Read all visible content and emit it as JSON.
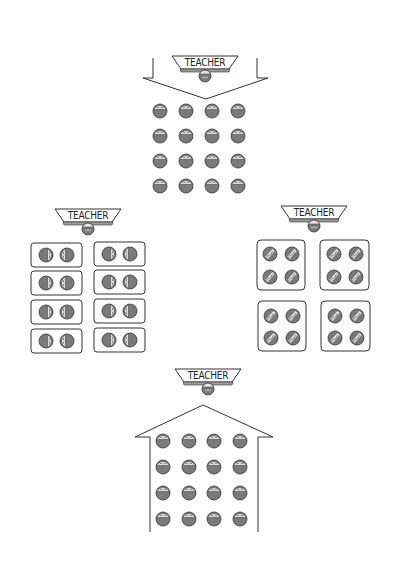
{
  "diagram": {
    "teacher_label": "TEACHER",
    "colors": {
      "outline": "#333333",
      "student_fill": "#7a7a7a",
      "student_face": "#e6e6e6",
      "banner_fill": "#ffffff",
      "banner_stripe": "#9a9a9a",
      "background": "#ffffff"
    },
    "layouts": [
      {
        "id": "traditional-rows",
        "position": "top-center",
        "teacher": {
          "label": "TEACHER",
          "cx": 205,
          "y": 56
        },
        "students": {
          "rows": 4,
          "cols": 4,
          "count": 16
        },
        "shape": "down-arrow"
      },
      {
        "id": "pairs",
        "position": "middle-left",
        "teacher": {
          "label": "TEACHER",
          "cx": 88,
          "y": 209
        },
        "groups": {
          "count": 8,
          "per_group": 2,
          "count_students": 16
        },
        "shape": "pair-tables"
      },
      {
        "id": "groups-of-four",
        "position": "middle-right",
        "teacher": {
          "label": "TEACHER",
          "cx": 314,
          "y": 206
        },
        "groups": {
          "count": 4,
          "per_group": 4,
          "count_students": 16
        },
        "shape": "quad-tables"
      },
      {
        "id": "students-facing-teacher",
        "position": "bottom-center",
        "teacher": {
          "label": "TEACHER",
          "cx": 208,
          "y": 369
        },
        "students": {
          "rows": 4,
          "cols": 4,
          "count": 16
        },
        "shape": "house-arrow-up"
      }
    ]
  }
}
